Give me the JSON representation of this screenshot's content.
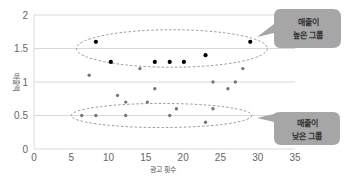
{
  "chart_data": {
    "type": "scatter",
    "title": "",
    "xlabel": "광고 횟수",
    "ylabel": "매출액",
    "xlim": [
      0,
      35
    ],
    "ylim": [
      0,
      2
    ],
    "x_ticks": [
      "0",
      "5",
      "10",
      "15",
      "20",
      "25",
      "30",
      "35"
    ],
    "y_ticks": [
      "0",
      "0.5",
      "1",
      "1.5",
      "2"
    ],
    "grid": "horizontal",
    "legend": null,
    "series": [
      {
        "name": "high",
        "color": "#000000",
        "points": [
          [
            8.3,
            1.6
          ],
          [
            10.3,
            1.3
          ],
          [
            16.2,
            1.3
          ],
          [
            18.2,
            1.3
          ],
          [
            20.1,
            1.3
          ],
          [
            23.0,
            1.4
          ],
          [
            29.0,
            1.6
          ]
        ]
      },
      {
        "name": "other",
        "color": "#777777",
        "points": [
          [
            7.4,
            1.1
          ],
          [
            14.2,
            1.2
          ],
          [
            28.0,
            1.2
          ],
          [
            24.0,
            1.0
          ],
          [
            27.0,
            1.0
          ],
          [
            16.2,
            0.9
          ],
          [
            26.0,
            0.9
          ],
          [
            11.2,
            0.8
          ],
          [
            12.3,
            0.7
          ],
          [
            15.2,
            0.7
          ],
          [
            19.1,
            0.6
          ],
          [
            24.0,
            0.6
          ],
          [
            6.4,
            0.5
          ],
          [
            8.3,
            0.5
          ],
          [
            12.3,
            0.5
          ],
          [
            18.2,
            0.5
          ],
          [
            23.0,
            0.4
          ]
        ]
      }
    ],
    "annotations": [
      {
        "type": "ellipse",
        "cx": 18.5,
        "cy": 1.5,
        "rx": 12.8,
        "ry": 0.28,
        "style": "dashed"
      },
      {
        "type": "ellipse",
        "cx": 17.1,
        "cy": 0.5,
        "rx": 12.1,
        "ry": 0.18,
        "style": "dashed"
      },
      {
        "type": "callout",
        "lines": [
          "매출이",
          "높은 그룹"
        ]
      },
      {
        "type": "callout",
        "lines": [
          "매출이",
          "낮은 그룹"
        ]
      }
    ]
  },
  "callouts": {
    "high": {
      "line1": "매출이",
      "line2": "높은 그룹"
    },
    "low": {
      "line1": "매출이",
      "line2": "낮은 그룹"
    }
  },
  "colors": {
    "callout_fill": "#a6a6a6",
    "grid": "#d9d9d9",
    "ellipse": "#808080"
  }
}
